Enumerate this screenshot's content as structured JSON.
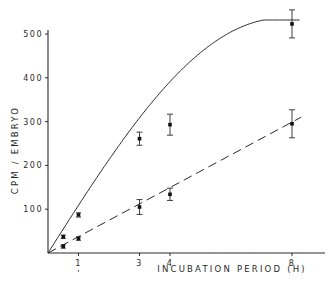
{
  "chart_data": {
    "type": "line",
    "title": "",
    "xlabel": "INCUBATION PERIOD (H)",
    "ylabel": "CPM / EMBRYO",
    "xlim": [
      0,
      9.2
    ],
    "ylim": [
      0,
      540
    ],
    "x_ticks": [
      1,
      3,
      4,
      8
    ],
    "x_tick_labels": [
      "1",
      "3",
      "4",
      "8"
    ],
    "y_ticks": [
      100,
      200,
      300,
      400,
      500
    ],
    "y_tick_labels": [
      "100",
      "200",
      "300",
      "400",
      "500"
    ],
    "grid": false,
    "legend": null,
    "series": [
      {
        "name": "upper (solid curve)",
        "line_style": "solid",
        "fit": "saturating curve",
        "x": [
          0.5,
          1,
          3,
          4,
          8
        ],
        "y": [
          37,
          87,
          261,
          293,
          523
        ],
        "error": [
          4,
          5,
          15,
          24,
          32
        ]
      },
      {
        "name": "lower (dashed line)",
        "line_style": "dashed",
        "fit": "linear",
        "x": [
          0.5,
          1,
          3,
          4,
          8
        ],
        "y": [
          15,
          33,
          105,
          134,
          295
        ],
        "error": [
          4,
          4,
          17,
          14,
          32
        ]
      }
    ]
  }
}
